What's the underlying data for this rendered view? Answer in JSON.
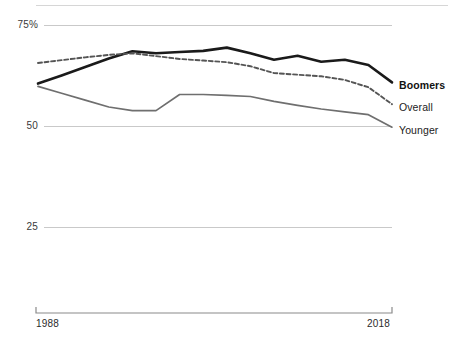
{
  "chart_data": {
    "type": "line",
    "title": "",
    "subtitle": "",
    "xlabel": "",
    "ylabel": "",
    "xlim": [
      1988,
      2018
    ],
    "ylim": [
      25,
      80
    ],
    "grid": true,
    "legend_position": "right-inline",
    "x_tick_labels": [
      "1988",
      "2018"
    ],
    "y_tick_labels": [
      "75%",
      "50",
      "25"
    ],
    "y_ticks": [
      75,
      50,
      25
    ],
    "x": [
      1988,
      1990,
      1992,
      1994,
      1996,
      1998,
      2000,
      2002,
      2004,
      2006,
      2008,
      2010,
      2012,
      2014,
      2016,
      2018
    ],
    "series": [
      {
        "name": "Boomers",
        "style": "solid-bold",
        "color": "#1a1a1a",
        "values": [
          60.5,
          62.5,
          64.6,
          66.7,
          68.5,
          68.0,
          68.3,
          68.6,
          69.4,
          68.0,
          66.4,
          67.4,
          65.9,
          66.4,
          65.1,
          60.8
        ]
      },
      {
        "name": "Overall",
        "style": "dashed",
        "color": "#555555",
        "values": [
          65.6,
          66.3,
          67.0,
          67.6,
          68.0,
          67.3,
          66.6,
          66.2,
          65.8,
          64.8,
          63.1,
          62.7,
          62.3,
          61.4,
          59.6,
          55.4
        ]
      },
      {
        "name": "Younger",
        "style": "solid-light",
        "color": "#6f6f6f",
        "values": [
          59.8,
          58.1,
          56.4,
          54.7,
          53.8,
          53.8,
          57.8,
          57.8,
          57.6,
          57.3,
          56.1,
          55.1,
          54.2,
          53.5,
          52.8,
          49.7
        ]
      }
    ]
  },
  "axis": {
    "x_start_label": "1988",
    "x_end_label": "2018"
  },
  "legend": {
    "items": [
      {
        "label": "Boomers"
      },
      {
        "label": "Overall"
      },
      {
        "label": "Younger"
      }
    ]
  },
  "colors": {
    "boomers": "#1a1a1a",
    "overall": "#555555",
    "younger": "#6f6f6f",
    "gridline": "#c9c9c9",
    "text": "#2b2b2b"
  }
}
